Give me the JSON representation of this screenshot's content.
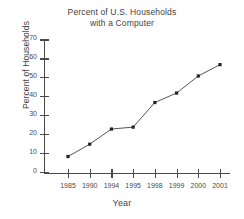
{
  "chart_data": {
    "type": "line",
    "title": "Percent of U.S. Households with a Computer",
    "title_lines": [
      "Percent of U.S. Households",
      "with a Computer"
    ],
    "xlabel": "Year",
    "ylabel": "Percent of Households",
    "categories": [
      "1985",
      "1990",
      "1994",
      "1995",
      "1998",
      "1999",
      "2000",
      "2001"
    ],
    "values": [
      8.5,
      15,
      23,
      24,
      37,
      42,
      51,
      57
    ],
    "series": [
      {
        "name": "Percent of Households",
        "values": [
          8.5,
          15,
          23,
          24,
          37,
          42,
          51,
          57
        ]
      }
    ],
    "ylim": [
      0,
      70
    ],
    "ytick_labels": [
      "0",
      "10",
      "20",
      "30",
      "40",
      "50",
      "60",
      "70"
    ],
    "ytick_values": [
      0,
      10,
      20,
      30,
      40,
      50,
      60,
      70
    ],
    "grid": false,
    "legend": false,
    "marker": "square",
    "line_color": "#555555",
    "marker_color": "#222222",
    "axis_color": "#4a4a4a",
    "background_color": "#ffffff"
  }
}
